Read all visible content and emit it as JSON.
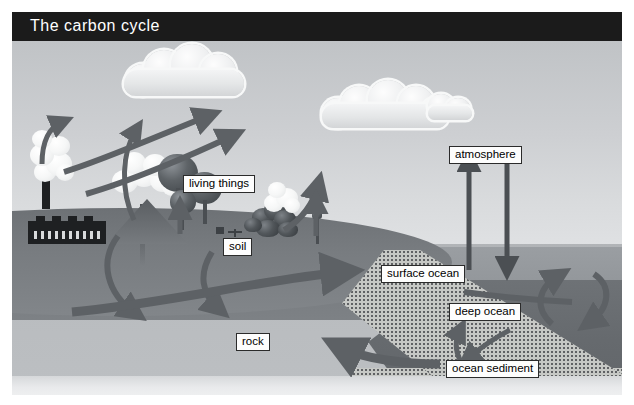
{
  "title": "The carbon cycle",
  "labels": {
    "living_things": "living things",
    "soil": "soil",
    "rock": "rock",
    "atmosphere": "atmosphere",
    "surface_ocean": "surface ocean",
    "deep_ocean": "deep ocean",
    "ocean_sediment": "ocean sediment"
  },
  "scene": {
    "objects": [
      "factory-with-smokestack",
      "volcano",
      "trees",
      "bushes",
      "clouds",
      "ocean",
      "ocean-sediment-wedge"
    ],
    "flows": [
      "factory-emissions-to-atmosphere",
      "volcano-emissions-to-atmosphere",
      "living-things-respiration-to-atmosphere",
      "photosynthesis-from-atmosphere-to-living-things",
      "soil-respiration-to-atmosphere",
      "living-things-to-soil",
      "soil-to-rock",
      "rock-to-soil",
      "soil-runoff-to-surface-ocean",
      "surface-ocean-to-atmosphere",
      "atmosphere-to-surface-ocean",
      "deep-ocean-upwelling",
      "deep-ocean-downwelling",
      "sediment-to-deep-ocean",
      "deep-ocean-to-sediment",
      "rock-to-ocean-sediment"
    ]
  },
  "colors": {
    "title_bar": "#1b1b1b",
    "title_text": "#ffffff",
    "sky": "#cdcfd2",
    "land": "#787c80",
    "rock": "#b9bcbf",
    "surface_ocean": "#969a9e",
    "deep_ocean": "#6a6e72",
    "sediment": "#c6c8c5",
    "arrow": "#5d6165",
    "label_bg": "#fdfdfd",
    "label_border": "#2b2b2b"
  }
}
